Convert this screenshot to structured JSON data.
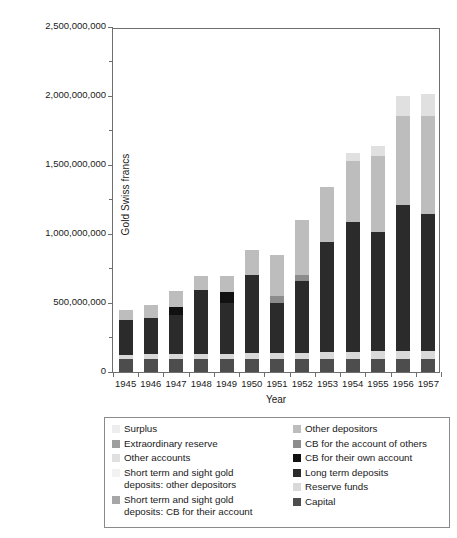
{
  "chart_data": {
    "type": "bar",
    "subtype": "stacked-vertical",
    "title": "",
    "xlabel": "Year",
    "ylabel": "Gold Swiss francs",
    "ylim": [
      0,
      2500000000
    ],
    "grid": false,
    "legend_position": "bottom",
    "y_ticks": [
      {
        "value": 0,
        "label": "0"
      },
      {
        "value": 500000000,
        "label": "500,000,000"
      },
      {
        "value": 1000000000,
        "label": "1,000,000,000"
      },
      {
        "value": 1500000000,
        "label": "1,500,000,000"
      },
      {
        "value": 2000000000,
        "label": "2,000,000,000"
      },
      {
        "value": 2500000000,
        "label": "2,500,000,000"
      }
    ],
    "categories": [
      "1945",
      "1946",
      "1947",
      "1948",
      "1949",
      "1950",
      "1951",
      "1952",
      "1953",
      "1954",
      "1955",
      "1956",
      "1957"
    ],
    "series": [
      {
        "name": "Capital",
        "color": "#4d4d4d",
        "values": [
          95000000,
          95000000,
          95000000,
          95000000,
          95000000,
          95000000,
          95000000,
          95000000,
          95000000,
          95000000,
          95000000,
          95000000,
          95000000
        ]
      },
      {
        "name": "Reserve funds",
        "color": "#d9d9d9",
        "values": [
          30000000,
          32000000,
          33000000,
          35000000,
          37000000,
          40000000,
          42000000,
          45000000,
          48000000,
          52000000,
          55000000,
          58000000,
          60000000
        ]
      },
      {
        "name": "Long term deposits",
        "color": "#2b2b2b",
        "values": [
          250000000,
          265000000,
          285000000,
          465000000,
          370000000,
          565000000,
          360000000,
          520000000,
          800000000,
          940000000,
          865000000,
          1060000000,
          990000000
        ]
      },
      {
        "name": "CB for their own account",
        "color": "#111111",
        "values": [
          0,
          0,
          60000000,
          0,
          75000000,
          0,
          0,
          0,
          0,
          0,
          0,
          0,
          0
        ]
      },
      {
        "name": "CB for the account of others",
        "color": "#8c8c8c",
        "values": [
          0,
          0,
          0,
          0,
          0,
          0,
          55000000,
          40000000,
          0,
          0,
          0,
          0,
          0
        ]
      },
      {
        "name": "Other depositors",
        "color": "#bdbdbd",
        "values": [
          75000000,
          95000000,
          115000000,
          100000000,
          120000000,
          185000000,
          295000000,
          400000000,
          400000000,
          440000000,
          550000000,
          640000000,
          710000000
        ]
      },
      {
        "name": "Short term and sight gold deposits: CB for their account",
        "color": "#a6a6a6",
        "values": [
          0,
          0,
          0,
          0,
          0,
          0,
          0,
          0,
          0,
          0,
          0,
          0,
          0
        ]
      },
      {
        "name": "Short term and sight gold deposits: other depositors",
        "color": "#f2f2f2",
        "values": [
          0,
          0,
          0,
          0,
          0,
          0,
          0,
          0,
          0,
          0,
          0,
          0,
          0
        ]
      },
      {
        "name": "Other accounts",
        "color": "#e0e0e0",
        "values": [
          0,
          0,
          0,
          0,
          0,
          0,
          0,
          0,
          0,
          60000000,
          75000000,
          145000000,
          160000000
        ]
      },
      {
        "name": "Extraordinary reserve",
        "color": "#9e9e9e",
        "values": [
          0,
          0,
          0,
          0,
          0,
          0,
          0,
          0,
          0,
          0,
          0,
          0,
          0
        ]
      },
      {
        "name": "Surplus",
        "color": "#ededed",
        "values": [
          0,
          0,
          0,
          0,
          0,
          0,
          0,
          0,
          0,
          0,
          0,
          0,
          0
        ]
      }
    ],
    "totals": [
      450000000,
      487000000,
      588000000,
      695000000,
      697000000,
      885000000,
      847000000,
      1100000000,
      1343000000,
      1587000000,
      1565000000,
      1998000000,
      2015000000
    ]
  },
  "legend": {
    "left_items": [
      {
        "label": "Surplus",
        "color": "#ededed"
      },
      {
        "label": "Extraordinary reserve",
        "color": "#9e9e9e"
      },
      {
        "label": "Other accounts",
        "color": "#e0e0e0"
      },
      {
        "label": "Short term and sight gold\ndeposits: other depositors",
        "color": "#f2f2f2"
      },
      {
        "label": "Short term and sight gold\ndeposits: CB for their account",
        "color": "#a6a6a6"
      }
    ],
    "right_items": [
      {
        "label": "Other depositors",
        "color": "#bdbdbd"
      },
      {
        "label": "CB for the account of others",
        "color": "#8c8c8c"
      },
      {
        "label": "CB for their own account",
        "color": "#111111"
      },
      {
        "label": "Long term deposits",
        "color": "#2b2b2b"
      },
      {
        "label": "Reserve funds",
        "color": "#d9d9d9"
      },
      {
        "label": "Capital",
        "color": "#4d4d4d"
      }
    ]
  },
  "axis": {
    "x_title": "Year",
    "y_title": "Gold Swiss francs"
  }
}
